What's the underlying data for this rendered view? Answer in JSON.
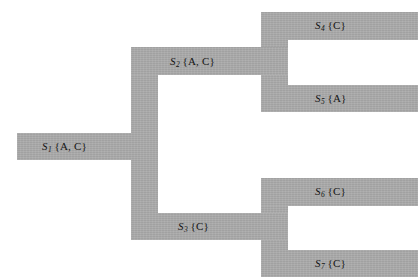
{
  "diagram": {
    "type": "scenario-tree",
    "title": "",
    "fill_color": "#ababab",
    "background_color": "#ffffff",
    "text_color": "#141414",
    "nodes": [
      {
        "id": "S1",
        "symbol": "S",
        "index": "1",
        "set": "{A, C}",
        "label": "S1 {A, C}",
        "level": 0,
        "x": 17,
        "y": 133,
        "width": 116,
        "height": 27,
        "label_x": 42,
        "label_y": 141
      },
      {
        "id": "S2",
        "symbol": "S",
        "index": "2",
        "set": "{A, C}",
        "label": "S2 {A, C}",
        "level": 1,
        "x": 131,
        "y": 47,
        "width": 157,
        "height": 28,
        "label_x": 170,
        "label_y": 56
      },
      {
        "id": "S3",
        "symbol": "S",
        "index": "3",
        "set": "{C}",
        "label": "S3 {C}",
        "level": 1,
        "x": 131,
        "y": 213,
        "width": 157,
        "height": 27,
        "label_x": 178,
        "label_y": 221
      },
      {
        "id": "S4",
        "symbol": "S",
        "index": "4",
        "set": "{C}",
        "label": "S4 {C}",
        "level": 2,
        "x": 261,
        "y": 12,
        "width": 157,
        "height": 28,
        "label_x": 315,
        "label_y": 20
      },
      {
        "id": "S5",
        "symbol": "S",
        "index": "5",
        "set": "{A}",
        "label": "S5 {A}",
        "level": 2,
        "x": 261,
        "y": 85,
        "width": 157,
        "height": 27,
        "label_x": 315,
        "label_y": 93
      },
      {
        "id": "S6",
        "symbol": "S",
        "index": "6",
        "set": "{C}",
        "label": "S6 {C}",
        "level": 2,
        "x": 261,
        "y": 178,
        "width": 157,
        "height": 28,
        "label_x": 315,
        "label_y": 186
      },
      {
        "id": "S7",
        "symbol": "S",
        "index": "7",
        "set": "{C}",
        "label": "S7 {C}",
        "level": 2,
        "x": 261,
        "y": 250,
        "width": 157,
        "height": 27,
        "label_x": 315,
        "label_y": 258
      }
    ],
    "connectors": [
      {
        "id": "trunk-S1-to-S2-S3",
        "from": "S1",
        "to": "S2,S3",
        "x": 131,
        "y": 47,
        "width": 27,
        "height": 193
      },
      {
        "id": "fork-S2-to-S4-S5",
        "from": "S2",
        "to": "S4,S5",
        "x": 261,
        "y": 12,
        "width": 27,
        "height": 100
      },
      {
        "id": "fork-S3-to-S6-S7",
        "from": "S3",
        "to": "S6,S7",
        "x": 261,
        "y": 178,
        "width": 27,
        "height": 99
      }
    ]
  }
}
